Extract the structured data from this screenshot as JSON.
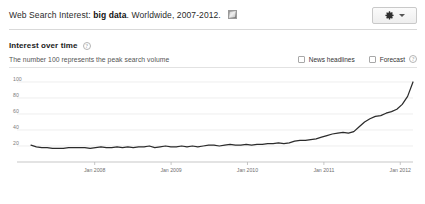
{
  "header": {
    "prefix": "Web Search Interest: ",
    "term": "big data",
    "suffix": ". Worldwide, 2007-2012.",
    "embed_icon": "embed-image-icon",
    "settings_icon": "gear-icon",
    "settings_caret": "chevron-down-icon"
  },
  "section": {
    "title": "Interest over time",
    "help_icon": "help-icon",
    "help_glyph": "?",
    "subtitle": "The number 100 represents the peak search volume",
    "controls": [
      {
        "label": "News headlines",
        "checked": false,
        "has_help": false
      },
      {
        "label": "Forecast",
        "checked": false,
        "has_help": true
      }
    ]
  },
  "chart_data": {
    "type": "line",
    "title": "Interest over time",
    "xlabel": "",
    "ylabel": "",
    "ylim": [
      0,
      110
    ],
    "yticks": [
      20,
      40,
      60,
      80,
      100
    ],
    "ytick_labels": [
      "20",
      "40",
      "60",
      "80",
      "100"
    ],
    "grid": true,
    "legend": "none",
    "xtick_labels": [
      "Jan 2008",
      "Jan 2009",
      "Jan 2010",
      "Jan 2011",
      "Jan 2012"
    ],
    "xtick_positions": [
      0.1667,
      0.3667,
      0.5667,
      0.7667,
      0.9667
    ],
    "x_range": [
      "Jan 2007",
      "Dec 2012"
    ],
    "series": [
      {
        "name": "big data",
        "color": "#2b2b2b",
        "x": [
          "2007-01",
          "2007-02",
          "2007-03",
          "2007-04",
          "2007-05",
          "2007-06",
          "2007-07",
          "2007-08",
          "2007-09",
          "2007-10",
          "2007-11",
          "2007-12",
          "2008-01",
          "2008-02",
          "2008-03",
          "2008-04",
          "2008-05",
          "2008-06",
          "2008-07",
          "2008-08",
          "2008-09",
          "2008-10",
          "2008-11",
          "2008-12",
          "2009-01",
          "2009-02",
          "2009-03",
          "2009-04",
          "2009-05",
          "2009-06",
          "2009-07",
          "2009-08",
          "2009-09",
          "2009-10",
          "2009-11",
          "2009-12",
          "2010-01",
          "2010-02",
          "2010-03",
          "2010-04",
          "2010-05",
          "2010-06",
          "2010-07",
          "2010-08",
          "2010-09",
          "2010-10",
          "2010-11",
          "2010-12",
          "2011-01",
          "2011-02",
          "2011-03",
          "2011-04",
          "2011-05",
          "2011-06",
          "2011-07",
          "2011-08",
          "2011-09",
          "2011-10",
          "2011-11",
          "2011-12",
          "2012-01",
          "2012-02",
          "2012-03",
          "2012-04",
          "2012-05",
          "2012-06",
          "2012-07",
          "2012-08",
          "2012-09",
          "2012-10",
          "2012-11",
          "2012-12"
        ],
        "values": [
          21,
          19,
          18,
          18,
          17,
          17,
          17,
          18,
          18,
          18,
          18,
          17,
          18,
          19,
          18,
          18,
          19,
          18,
          19,
          18,
          19,
          19,
          20,
          18,
          19,
          20,
          19,
          19,
          20,
          19,
          20,
          19,
          20,
          21,
          21,
          20,
          21,
          22,
          21,
          21,
          22,
          21,
          22,
          22,
          23,
          23,
          24,
          23,
          24,
          26,
          27,
          27,
          28,
          29,
          31,
          33,
          35,
          36,
          37,
          36,
          38,
          44,
          50,
          54,
          57,
          58,
          61,
          63,
          66,
          72,
          82,
          100
        ]
      }
    ]
  }
}
